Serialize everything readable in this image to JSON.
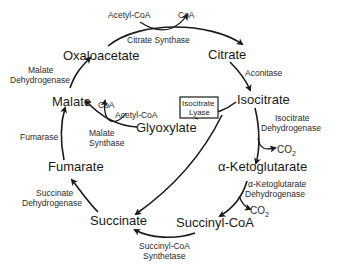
{
  "metabolites": {
    "oxaloacetate": "Oxaloacetate",
    "citrate": "Citrate",
    "isocitrate": "Isocitrate",
    "alpha_ketoglutarate": "α-Ketoglutarate",
    "succinyl_coa": "Succinyl-CoA",
    "succinate": "Succinate",
    "fumarate": "Fumarate",
    "malate": "Malate",
    "glyoxylate": "Glyoxylate"
  },
  "enzymes": {
    "citrate_synthase": "Citrate Synthase",
    "aconitase": "Aconitase",
    "isocitrate_dh_1": "Isocitrate",
    "isocitrate_dh_2": "Dehydrogenase",
    "akg_dh_1": "α-Ketoglutarate",
    "akg_dh_2": "Dehydrogenase",
    "succinyl_coa_synthetase_1": "Succinyl-CoA",
    "succinyl_coa_synthetase_2": "Synthetase",
    "succinate_dh_1": "Succinate",
    "succinate_dh_2": "Dehydrogenase",
    "fumarase": "Fumarase",
    "malate_dh_1": "Malate",
    "malate_dh_2": "Dehydrogenase",
    "malate_synthase_1": "Malate",
    "malate_synthase_2": "Synthase",
    "isocitrate_lyase_1": "Isocitrate",
    "isocitrate_lyase_2": "Lyase"
  },
  "cofactors": {
    "acetyl_coa_top": "Acetyl-CoA",
    "coa_top": "CoA",
    "acetyl_coa_mid": "Acetyl-CoA",
    "coa_mid": "CoA",
    "co2_1": "CO",
    "co2_1_sub": "2",
    "co2_2": "CO",
    "co2_2_sub": "2"
  }
}
